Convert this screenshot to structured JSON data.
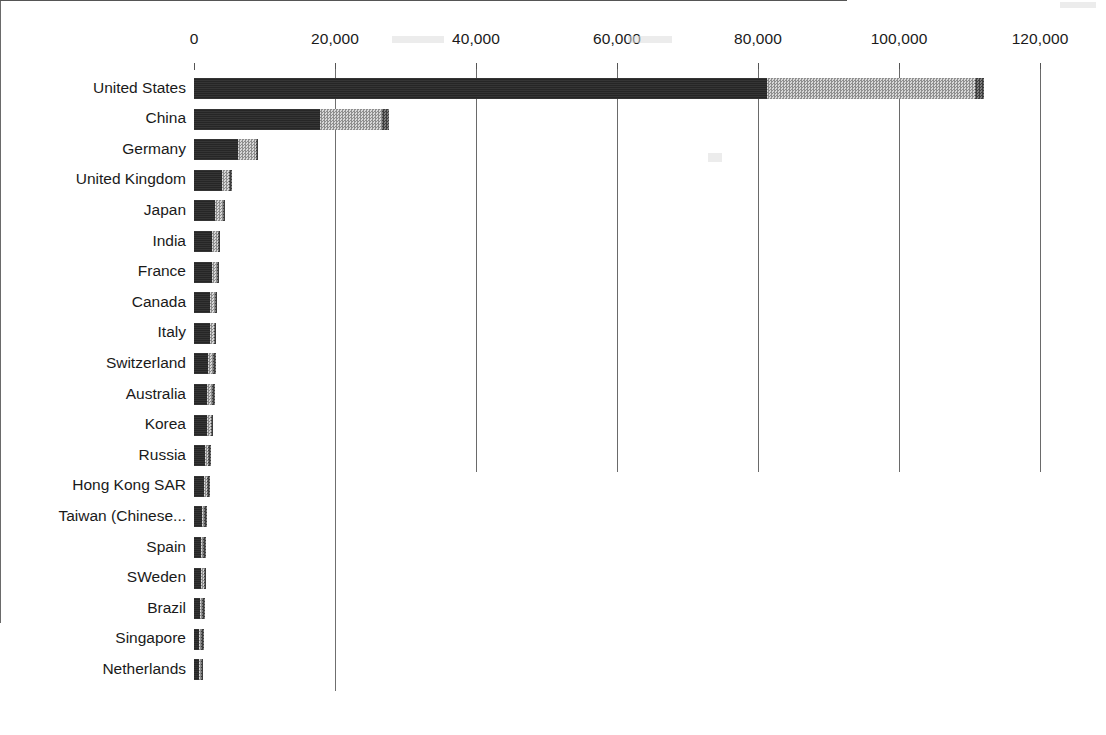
{
  "chart_data": {
    "type": "bar",
    "orientation": "horizontal",
    "stacked": true,
    "title": "",
    "subtitle": "",
    "xlabel": "",
    "ylabel": "",
    "xlim": [
      0,
      120000
    ],
    "xticks": [
      0,
      20000,
      40000,
      60000,
      80000,
      100000,
      120000
    ],
    "xtick_labels": [
      "0",
      "20,000",
      "40,000",
      "60,000",
      "80,000",
      "100,000",
      "120,000"
    ],
    "grid": "vertical",
    "legend_position": "bottom-center",
    "categories": [
      "United States",
      "China",
      "Germany",
      "United Kingdom",
      "Japan",
      "India",
      "France",
      "Canada",
      "Italy",
      "Switzerland",
      "Australia",
      "Korea",
      "Russia",
      "Hong Kong SAR",
      "Taiwan (Chinese...",
      "Spain",
      "SWeden",
      "Brazil",
      "Singapore",
      "Netherlands"
    ],
    "series": [
      {
        "name": "US$50–100 m",
        "color": "#262626",
        "pattern": "solid-dark",
        "values": [
          81300,
          17900,
          6250,
          4000,
          3000,
          2500,
          2500,
          2300,
          2200,
          2000,
          1900,
          1800,
          1500,
          1400,
          1100,
          1000,
          1000,
          900,
          750,
          700
        ]
      },
      {
        "name": "US$100–500 m",
        "color": "#b4b4b4",
        "pattern": "light-checker",
        "values": [
          29500,
          8800,
          2500,
          1000,
          1100,
          900,
          700,
          650,
          600,
          700,
          700,
          600,
          550,
          450,
          350,
          280,
          350,
          300,
          280,
          250
        ]
      },
      {
        "name": "> USD$500 m",
        "color": "#5c5c5c",
        "pattern": "mid-checker",
        "values": [
          1200,
          900,
          250,
          150,
          120,
          100,
          100,
          80,
          80,
          80,
          80,
          70,
          60,
          60,
          50,
          40,
          40,
          40,
          30,
          30
        ]
      }
    ],
    "totals": [
      112000,
      27600,
      9000,
      5150,
      4220,
      3500,
      3300,
      3030,
      2880,
      2780,
      2680,
      2470,
      2110,
      1910,
      1500,
      1320,
      1390,
      1240,
      1060,
      980
    ]
  },
  "legend": {
    "items": [
      {
        "label": "US$50–100 m",
        "swatch": "swatch-dark"
      },
      {
        "label": "US$100–500 m",
        "swatch": "swatch-light"
      },
      {
        "label": "> USD$500 m",
        "swatch": "swatch-mid"
      }
    ]
  }
}
